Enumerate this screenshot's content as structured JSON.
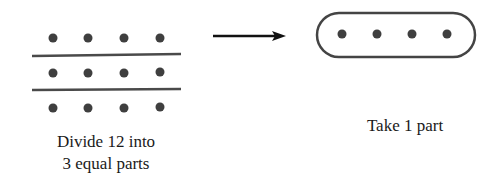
{
  "diagram": {
    "left": {
      "dots_rows": 3,
      "dots_per_row": 4,
      "total": 12,
      "caption_line1": "Divide 12 into",
      "caption_line2": "3 equal parts"
    },
    "arrow": {
      "direction": "right"
    },
    "right": {
      "dots": 4,
      "caption": "Take 1 part"
    },
    "colors": {
      "dot": "#3f3f3f",
      "divider": "#4a4a4a",
      "arrow": "#111111",
      "outline": "#444444",
      "text": "#1a1a1a"
    }
  }
}
